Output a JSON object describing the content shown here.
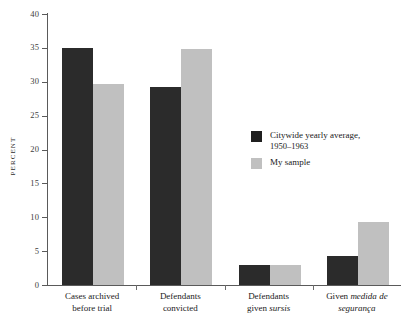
{
  "chart_data": {
    "type": "bar",
    "title": "",
    "xlabel": "",
    "ylabel": "PERCENT",
    "ylim": [
      0,
      40
    ],
    "ytick_step": 5,
    "yticks": [
      "40",
      "35",
      "30",
      "25",
      "20",
      "15",
      "10",
      "5",
      "0"
    ],
    "grid": false,
    "legend_position": "inside-right",
    "categories": [
      "Cases archived before trial",
      "Defendants convicted",
      "Defendants given sursis",
      "Given medida de segurança"
    ],
    "category_lines": [
      [
        "Cases archived",
        "before trial"
      ],
      [
        "Defendants",
        "convicted"
      ],
      [
        "Defendants",
        "given sursis"
      ],
      [
        "Given medida de",
        "segurança"
      ]
    ],
    "series": [
      {
        "name": "Citywide yearly average, 1950–1963",
        "color": "#2b2b2b",
        "values": [
          35.0,
          29.3,
          2.9,
          4.3
        ]
      },
      {
        "name": "My sample",
        "color": "#c0c0c0",
        "values": [
          29.6,
          34.8,
          3.0,
          9.3
        ]
      }
    ]
  },
  "legend": {
    "entries": [
      {
        "label": "Citywide yearly average,",
        "sublabel": "1950–1963",
        "swatch": "series-a"
      },
      {
        "label": "My sample",
        "sublabel": "",
        "swatch": "series-b"
      }
    ]
  },
  "axis": {
    "y_title": "PERCENT"
  }
}
